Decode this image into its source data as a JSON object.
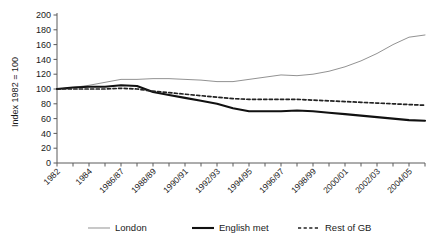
{
  "chart_data": {
    "type": "line",
    "title": "",
    "xlabel": "",
    "ylabel": "Index 1982 = 100",
    "ylim": [
      0,
      200
    ],
    "ytick_values": [
      0,
      20,
      40,
      60,
      80,
      100,
      120,
      140,
      160,
      180,
      200
    ],
    "ytick_labels": [
      "0",
      "20",
      "40",
      "60",
      "80",
      "100",
      "120",
      "140",
      "160",
      "180",
      "200"
    ],
    "grid": false,
    "legend_position": "bottom",
    "x": [
      "1982",
      "1983",
      "1984",
      "1985/86",
      "1986/87",
      "1987/88",
      "1988/89",
      "1989/90",
      "1990/91",
      "1991/92",
      "1992/93",
      "1993/94",
      "1994/95",
      "1995/96",
      "1996/97",
      "1997/98",
      "1998/99",
      "1999/00",
      "2000/01",
      "2001/02",
      "2002/03",
      "2003/04",
      "2004/05",
      "2005/06"
    ],
    "xtick_labels_shown": [
      "1982",
      "1984",
      "1986/87",
      "1988/89",
      "1990/91",
      "1992/93",
      "1994/95",
      "1996/97",
      "1998/99",
      "2000/01",
      "2002/03",
      "2004/05"
    ],
    "series": [
      {
        "name": "London",
        "color": "#8c8c8c",
        "style": "solid-thin",
        "values": [
          100,
          102,
          105,
          109,
          113,
          113,
          114,
          114,
          113,
          112,
          110,
          110,
          113,
          116,
          119,
          118,
          120,
          124,
          130,
          138,
          148,
          160,
          170,
          173
        ]
      },
      {
        "name": "English met",
        "color": "#111111",
        "style": "solid-thick",
        "values": [
          100,
          102,
          103,
          103,
          105,
          104,
          96,
          92,
          88,
          84,
          80,
          74,
          70,
          70,
          70,
          71,
          70,
          68,
          66,
          64,
          62,
          60,
          58,
          57
        ]
      },
      {
        "name": "Rest of GB",
        "color": "#222222",
        "style": "dashed",
        "values": [
          100,
          100,
          100,
          100,
          101,
          100,
          97,
          95,
          93,
          91,
          89,
          87,
          86,
          86,
          86,
          86,
          85,
          84,
          83,
          82,
          81,
          80,
          79,
          78
        ]
      }
    ]
  }
}
